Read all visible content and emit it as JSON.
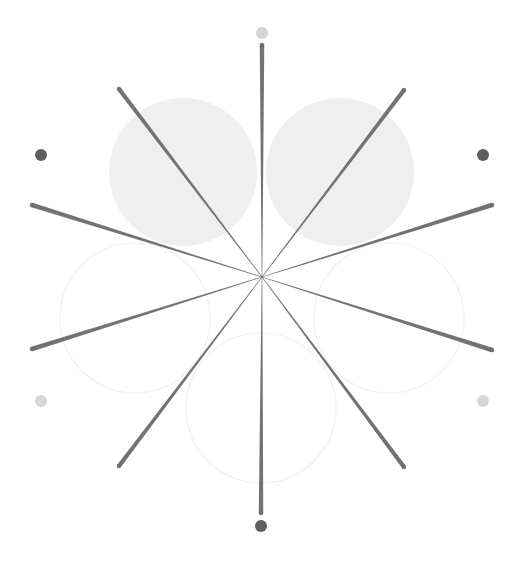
{
  "canvas": {
    "width": 530,
    "height": 567,
    "background": "#ffffff"
  },
  "center": {
    "x": 262,
    "y": 277
  },
  "colors": {
    "spoke": "#6b6b6b",
    "filled_circle": "#efefef",
    "outline_circle": "#f1f1f1",
    "dot_dark": "#5e5e5e",
    "dot_light": "#d6d6d6"
  },
  "filled_circles": [
    {
      "id": "upper-left",
      "cx": 183,
      "cy": 172,
      "r": 74
    },
    {
      "id": "upper-right",
      "cx": 340,
      "cy": 172,
      "r": 74
    }
  ],
  "outline_circles": [
    {
      "id": "left",
      "cx": 135,
      "cy": 318,
      "r": 75
    },
    {
      "id": "bottom",
      "cx": 261,
      "cy": 408,
      "r": 75
    },
    {
      "id": "right",
      "cx": 389,
      "cy": 318,
      "r": 75
    }
  ],
  "spokes": [
    {
      "id": "top",
      "x": 262,
      "y": 45
    },
    {
      "id": "upper-right",
      "x": 404,
      "y": 90
    },
    {
      "id": "right-upper",
      "x": 492,
      "y": 205
    },
    {
      "id": "right-lower",
      "x": 492,
      "y": 350
    },
    {
      "id": "lower-right",
      "x": 404,
      "y": 467
    },
    {
      "id": "bottom",
      "x": 261,
      "y": 513
    },
    {
      "id": "lower-left",
      "x": 119,
      "y": 466
    },
    {
      "id": "left-lower",
      "x": 32,
      "y": 349
    },
    {
      "id": "left-upper",
      "x": 32,
      "y": 205
    },
    {
      "id": "upper-left",
      "x": 119,
      "y": 89
    }
  ],
  "spoke_width": {
    "tip": 4.5,
    "center": 0.6
  },
  "dots": [
    {
      "id": "top",
      "cx": 262,
      "cy": 33,
      "r": 6,
      "tone": "light"
    },
    {
      "id": "upper-right",
      "cx": 483,
      "cy": 155,
      "r": 6,
      "tone": "dark"
    },
    {
      "id": "lower-right",
      "cx": 483,
      "cy": 401,
      "r": 6,
      "tone": "light"
    },
    {
      "id": "bottom",
      "cx": 261,
      "cy": 526,
      "r": 6,
      "tone": "dark"
    },
    {
      "id": "lower-left",
      "cx": 41,
      "cy": 401,
      "r": 6,
      "tone": "light"
    },
    {
      "id": "upper-left",
      "cx": 41,
      "cy": 155,
      "r": 6,
      "tone": "dark"
    }
  ]
}
